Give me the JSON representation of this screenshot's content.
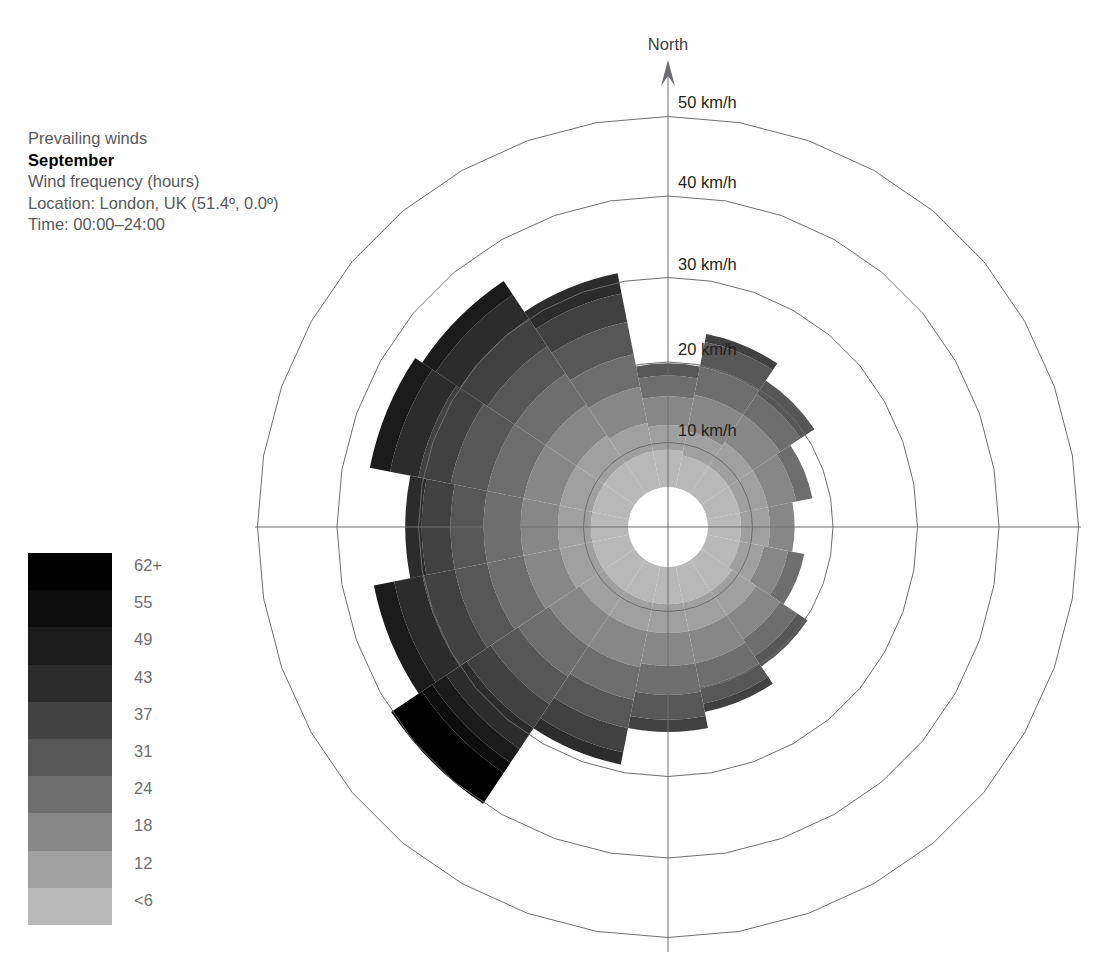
{
  "caption": {
    "line1": "Prevailing winds",
    "month": "September",
    "line3": "Wind frequency (hours)",
    "line4": "Location: London, UK (51.4º, 0.0º)",
    "line5": "Time: 00:00–24:00"
  },
  "north_label": "North",
  "legend": {
    "title": "wind speed km/h",
    "labels": [
      "62+",
      "55",
      "49",
      "43",
      "37",
      "31",
      "24",
      "18",
      "12",
      "<6"
    ],
    "colors": [
      "#000000",
      "#0d0d0d",
      "#1b1b1b",
      "#2c2c2c",
      "#414141",
      "#575757",
      "#6e6e6e",
      "#878787",
      "#a0a0a0",
      "#b9b9b9"
    ]
  },
  "chart_data": {
    "type": "wind-rose",
    "ylabel": "Wind frequency (hours)",
    "radial_axis": {
      "unit": "km/h",
      "tick_labels": [
        "10 km/h",
        "20 km/h",
        "30 km/h",
        "40 km/h",
        "50 km/h"
      ],
      "ticks": [
        10,
        20,
        30,
        40,
        50
      ],
      "rmax": 50,
      "hole": 5
    },
    "speed_bins": [
      {
        "label": "<6",
        "max": 6,
        "color": "#b9b9b9"
      },
      {
        "label": "12",
        "max": 12,
        "color": "#a0a0a0"
      },
      {
        "label": "18",
        "max": 18,
        "color": "#878787"
      },
      {
        "label": "24",
        "max": 24,
        "color": "#6e6e6e"
      },
      {
        "label": "31",
        "max": 31,
        "color": "#575757"
      },
      {
        "label": "37",
        "max": 37,
        "color": "#414141"
      },
      {
        "label": "43",
        "max": 43,
        "color": "#2c2c2c"
      },
      {
        "label": "49",
        "max": 49,
        "color": "#1b1b1b"
      },
      {
        "label": "55",
        "max": 55,
        "color": "#0d0d0d"
      },
      {
        "label": "62+",
        "max": 62,
        "color": "#000000"
      }
    ],
    "sector_count": 16,
    "sector_width_deg": 22.5,
    "directions": [
      "N",
      "NNE",
      "NE",
      "ENE",
      "E",
      "ESE",
      "SE",
      "SSE",
      "S",
      "SSW",
      "SW",
      "WSW",
      "W",
      "WNW",
      "NW",
      "NNW"
    ],
    "series": [
      {
        "direction": "N",
        "bearing": 0,
        "bands": [
          4.5,
          3.0,
          3.5,
          2.5,
          1.5,
          0,
          0,
          0,
          0,
          0
        ],
        "total": 15.0
      },
      {
        "direction": "NNE",
        "bearing": 22.5,
        "bands": [
          4.0,
          3.0,
          4.5,
          3.5,
          3.0,
          1.0,
          0,
          0,
          0,
          0
        ],
        "total": 19.0
      },
      {
        "direction": "NE",
        "bearing": 45,
        "bands": [
          4.0,
          3.5,
          4.0,
          3.0,
          2.0,
          0,
          0,
          0,
          0,
          0
        ],
        "total": 16.5
      },
      {
        "direction": "ENE",
        "bearing": 67.5,
        "bands": [
          4.0,
          3.5,
          3.5,
          2.0,
          0,
          0,
          0,
          0,
          0,
          0
        ],
        "total": 13.0
      },
      {
        "direction": "E",
        "bearing": 90,
        "bands": [
          4.0,
          3.5,
          3.0,
          0,
          0,
          0,
          0,
          0,
          0,
          0
        ],
        "total": 10.5
      },
      {
        "direction": "ESE",
        "bearing": 112.5,
        "bands": [
          4.0,
          3.0,
          3.0,
          2.0,
          0,
          0,
          0,
          0,
          0,
          0
        ],
        "total": 12.0
      },
      {
        "direction": "SE",
        "bearing": 135,
        "bands": [
          4.5,
          3.5,
          3.5,
          2.5,
          1.5,
          0,
          0,
          0,
          0,
          0
        ],
        "total": 15.5
      },
      {
        "direction": "SSE",
        "bearing": 157.5,
        "bands": [
          4.5,
          3.5,
          4.0,
          3.0,
          2.0,
          1.0,
          0,
          0,
          0,
          0
        ],
        "total": 18.0
      },
      {
        "direction": "S",
        "bearing": 180,
        "bands": [
          4.5,
          3.5,
          4.0,
          3.5,
          3.0,
          1.5,
          0,
          0,
          0,
          0
        ],
        "total": 20.0
      },
      {
        "direction": "SSW",
        "bearing": 202.5,
        "bands": [
          4.5,
          3.5,
          4.5,
          4.0,
          3.5,
          3.0,
          1.5,
          0,
          0,
          0
        ],
        "total": 24.5
      },
      {
        "direction": "SW",
        "bearing": 225,
        "bands": [
          4.5,
          3.5,
          4.5,
          4.5,
          4.0,
          3.5,
          3.0,
          2.0,
          1.5,
          4.5
        ],
        "total": 35.5
      },
      {
        "direction": "WSW",
        "bearing": 247.5,
        "bands": [
          4.5,
          4.0,
          4.5,
          4.5,
          4.0,
          4.0,
          3.5,
          2.5,
          0,
          0
        ],
        "total": 31.5
      },
      {
        "direction": "W",
        "bearing": 270,
        "bands": [
          4.5,
          4.0,
          4.5,
          4.5,
          4.0,
          3.5,
          2.0,
          0,
          0,
          0
        ],
        "total": 29.0
      },
      {
        "direction": "WNW",
        "bearing": 292.5,
        "bands": [
          4.5,
          4.0,
          4.5,
          4.5,
          4.5,
          4.0,
          3.5,
          2.5,
          0,
          0
        ],
        "total": 32.0
      },
      {
        "direction": "NW",
        "bearing": 315,
        "bands": [
          4.5,
          4.0,
          4.5,
          4.5,
          4.0,
          4.0,
          3.5,
          2.0,
          0,
          0
        ],
        "total": 31.0
      },
      {
        "direction": "NNW",
        "bearing": 337.5,
        "bands": [
          4.5,
          3.5,
          4.5,
          4.0,
          4.0,
          3.5,
          2.5,
          0,
          0,
          0
        ],
        "total": 26.5
      }
    ]
  }
}
